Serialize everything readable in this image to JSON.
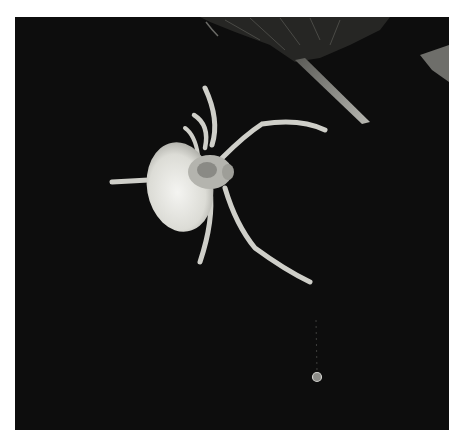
{
  "image": {
    "subject": "spider",
    "scene": "pale spider hanging upside-down from a dark leaf on a thread, black night background",
    "colors": {
      "background": "#0d0d0d",
      "page": "#ffffff",
      "spider_body": "#e6e6e2",
      "spider_legs": "#cfcfc9",
      "leaf": "#2a2a2a",
      "leaf_highlight": "#9a9a94"
    },
    "elements": [
      "leaf",
      "spider-abdomen",
      "spider-cephalothorax",
      "spider-legs",
      "silk-thread",
      "dew-drop"
    ]
  }
}
